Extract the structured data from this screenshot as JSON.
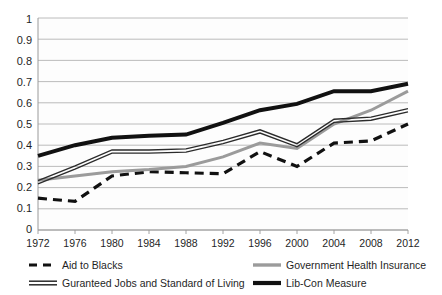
{
  "chart_data": {
    "type": "line",
    "title": "",
    "subtitle": "",
    "xlabel": "",
    "ylabel": "",
    "grid": true,
    "legend_position": "bottom",
    "xlim": [
      1972,
      2012
    ],
    "ylim": [
      0,
      1
    ],
    "ytick_step": 0.1,
    "categories": [
      1972,
      1976,
      1980,
      1984,
      1988,
      1992,
      1996,
      2000,
      2004,
      2008,
      2012
    ],
    "xtick_labels": [
      "1972",
      "1976",
      "1980",
      "1984",
      "1988",
      "1992",
      "1996",
      "2000",
      "2004",
      "2008",
      "2012"
    ],
    "ytick_labels": [
      "0",
      "0.1",
      "0.2",
      "0.3",
      "0.4",
      "0.5",
      "0.6",
      "0.7",
      "0.8",
      "0.9",
      "1"
    ],
    "series": [
      {
        "name": "Aid to Blacks",
        "style": "dashed",
        "color": "#111111",
        "width": 3.2,
        "values": [
          0.15,
          0.135,
          0.255,
          0.275,
          0.27,
          0.265,
          0.37,
          0.3,
          0.41,
          0.42,
          0.5
        ]
      },
      {
        "name": "Government Health Insurance",
        "style": "solid",
        "color": "#9b9b9b",
        "width": 3.0,
        "values": [
          0.235,
          0.255,
          0.275,
          0.285,
          0.3,
          0.345,
          0.41,
          0.385,
          0.5,
          0.565,
          0.655
        ]
      },
      {
        "name": "Guranteed Jobs and Standard of Living",
        "style": "double",
        "color": "#2b2b2b",
        "width": 3.0,
        "values": [
          0.225,
          0.295,
          0.37,
          0.37,
          0.375,
          0.415,
          0.465,
          0.4,
          0.515,
          0.525,
          0.565
        ]
      },
      {
        "name": "Lib-Con Measure",
        "style": "solid",
        "color": "#111111",
        "width": 4.0,
        "values": [
          0.35,
          0.4,
          0.435,
          0.445,
          0.45,
          0.505,
          0.565,
          0.595,
          0.655,
          0.655,
          0.69
        ]
      }
    ]
  },
  "legend": {
    "items": [
      {
        "label": "Aid to Blacks",
        "marker": "dashed-marker"
      },
      {
        "label": "Government Health Insurance",
        "marker": "gray-line-marker"
      },
      {
        "label": "Guranteed Jobs and Standard of Living",
        "marker": "double-line-marker"
      },
      {
        "label": "Lib-Con Measure",
        "marker": "thick-black-line-marker"
      }
    ]
  },
  "colors": {
    "plot_background": "#fdfdfd",
    "gridline": "#b4b4b4",
    "axis": "#9a9a9a",
    "text": "#1f1f1f"
  }
}
